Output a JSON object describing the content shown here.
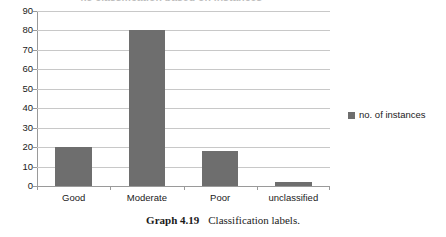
{
  "chart_data": {
    "type": "bar",
    "title": "4.5 classification based on instances",
    "categories": [
      "Good",
      "Moderate",
      "Poor",
      "unclassified"
    ],
    "values": [
      20,
      80,
      18,
      2
    ],
    "series": [
      {
        "name": "no. of instances",
        "values": [
          20,
          80,
          18,
          2
        ]
      }
    ],
    "xlabel": "",
    "ylabel": "",
    "ylim": [
      0,
      90
    ],
    "ytick_step": 10,
    "yticks": [
      "90",
      "80",
      "70",
      "60",
      "50",
      "40",
      "30",
      "20",
      "10",
      "0"
    ],
    "grid": true,
    "legend_position": "right",
    "bar_color": "#6e6e6e",
    "gridline_color": "#c8c8c8",
    "axis_color": "#9a9a9a"
  },
  "legend": {
    "entries": [
      {
        "label": "no. of instances",
        "color": "#6e6e6e"
      }
    ]
  },
  "caption": {
    "label": "Graph 4.19",
    "text": "Classification labels."
  }
}
